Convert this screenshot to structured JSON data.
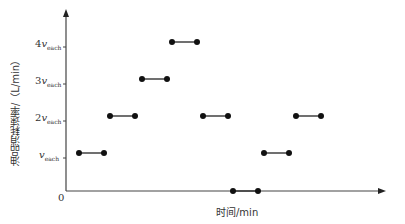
{
  "chart_data": {
    "type": "line",
    "title": "",
    "xlabel": "时间/min",
    "ylabel": "油品消耗速率/（L/min）",
    "origin_label": "0",
    "y_ticks": [
      {
        "coef": "",
        "sub": "each",
        "value": 1
      },
      {
        "coef": "2",
        "sub": "each",
        "value": 2
      },
      {
        "coef": "3",
        "sub": "each",
        "value": 3
      },
      {
        "coef": "4",
        "sub": "each",
        "value": 4
      }
    ],
    "y_tick_symbol": "v",
    "segments": [
      {
        "x_start": 1,
        "x_end": 2,
        "value": 1
      },
      {
        "x_start": 2,
        "x_end": 3,
        "value": 2
      },
      {
        "x_start": 3,
        "x_end": 4,
        "value": 3
      },
      {
        "x_start": 4,
        "x_end": 5,
        "value": 4
      },
      {
        "x_start": 5,
        "x_end": 6,
        "value": 2
      },
      {
        "x_start": 6,
        "x_end": 7,
        "value": 0
      },
      {
        "x_start": 7,
        "x_end": 8,
        "value": 1
      },
      {
        "x_start": 8,
        "x_end": 9,
        "value": 2
      }
    ],
    "ylim": [
      0,
      4.5
    ],
    "grid": false,
    "legend": null
  }
}
